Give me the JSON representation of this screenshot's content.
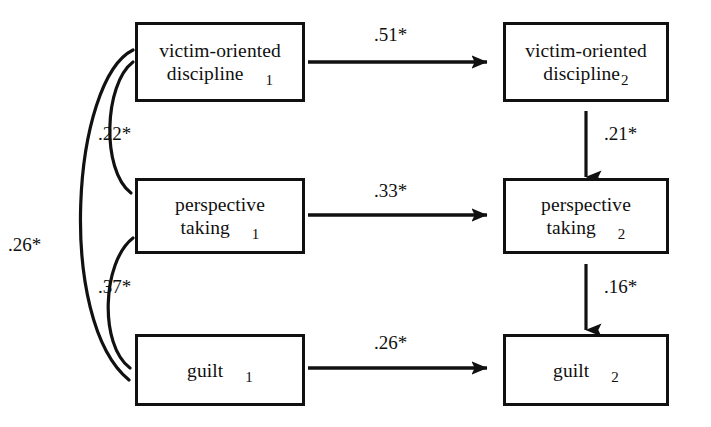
{
  "figure": {
    "type": "path-diagram",
    "background_color": "#ffffff",
    "line_color": "#111111"
  },
  "nodes": [
    {
      "id": "victim-oriented-discipline-1",
      "line1": "victim-oriented",
      "line2": "discipline",
      "subscript": "1",
      "wave": "1",
      "column": "left",
      "row": 1,
      "subscript_gap": "wide"
    },
    {
      "id": "victim-oriented-discipline-2",
      "line1": "victim-oriented",
      "line2": "discipline",
      "subscript": "2",
      "wave": "2",
      "column": "right",
      "row": 1,
      "subscript_gap": "narrow"
    },
    {
      "id": "perspective-taking-1",
      "line1": "perspective",
      "line2": "taking",
      "subscript": "1",
      "wave": "1",
      "column": "left",
      "row": 2,
      "subscript_gap": "wide"
    },
    {
      "id": "perspective-taking-2",
      "line1": "perspective",
      "line2": "taking",
      "subscript": "2",
      "wave": "2",
      "column": "right",
      "row": 2,
      "subscript_gap": "wide"
    },
    {
      "id": "guilt-1",
      "line1": "",
      "line2": "guilt",
      "subscript": "1",
      "wave": "1",
      "column": "left",
      "row": 3,
      "subscript_gap": "wide"
    },
    {
      "id": "guilt-2",
      "line1": "",
      "line2": "guilt",
      "subscript": "2",
      "wave": "2",
      "column": "right",
      "row": 3,
      "subscript_gap": "wide"
    }
  ],
  "paths": [
    {
      "id": "vod1-to-vod2",
      "label": ".51*",
      "kind": "directed",
      "orientation": "horizontal",
      "from": "victim-oriented-discipline-1",
      "to": "victim-oriented-discipline-2"
    },
    {
      "id": "pt1-to-pt2",
      "label": ".33*",
      "kind": "directed",
      "orientation": "horizontal",
      "from": "perspective-taking-1",
      "to": "perspective-taking-2"
    },
    {
      "id": "guilt1-to-guilt2",
      "label": ".26*",
      "kind": "directed",
      "orientation": "horizontal",
      "from": "guilt-1",
      "to": "guilt-2"
    },
    {
      "id": "vod2-to-pt2",
      "label": ".21*",
      "kind": "directed",
      "orientation": "vertical",
      "from": "victim-oriented-discipline-2",
      "to": "perspective-taking-2"
    },
    {
      "id": "pt2-to-guilt2",
      "label": ".16*",
      "kind": "directed",
      "orientation": "vertical",
      "from": "perspective-taking-2",
      "to": "guilt-2"
    },
    {
      "id": "vod1-with-pt1",
      "label": ".22*",
      "kind": "correlation",
      "orientation": "curve",
      "from": "victim-oriented-discipline-1",
      "to": "perspective-taking-1"
    },
    {
      "id": "pt1-with-guilt1",
      "label": ".37*",
      "kind": "correlation",
      "orientation": "curve",
      "from": "perspective-taking-1",
      "to": "guilt-1"
    },
    {
      "id": "vod1-with-guilt1",
      "label": ".26*",
      "kind": "correlation",
      "orientation": "curve",
      "from": "victim-oriented-discipline-1",
      "to": "guilt-1"
    }
  ],
  "labels": {
    "p51": ".51*",
    "p33": ".33*",
    "p26_horizontal": ".26*",
    "p21": ".21*",
    "p16": ".16*",
    "p22": ".22*",
    "p37": ".37*",
    "p26_outer": ".26*"
  }
}
